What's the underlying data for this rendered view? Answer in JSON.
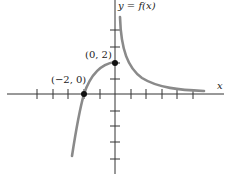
{
  "figure": {
    "function_label": "y = f(x)",
    "x_axis_label": "x",
    "points": [
      {
        "label": "(−2, 0)",
        "x": -2,
        "y": 0
      },
      {
        "label": "(0, 2)",
        "x": 0,
        "y": 2
      }
    ],
    "x_ticks": [
      -7,
      -6,
      -5,
      -4,
      -3,
      -2,
      -1,
      1,
      2,
      3,
      4,
      5
    ],
    "y_ticks": [
      -5,
      -4,
      -3,
      -2,
      -1,
      1,
      2,
      3,
      4
    ],
    "colors": {
      "axis": "#333333",
      "curve": "#8a8a8a",
      "point": "#111111"
    }
  }
}
